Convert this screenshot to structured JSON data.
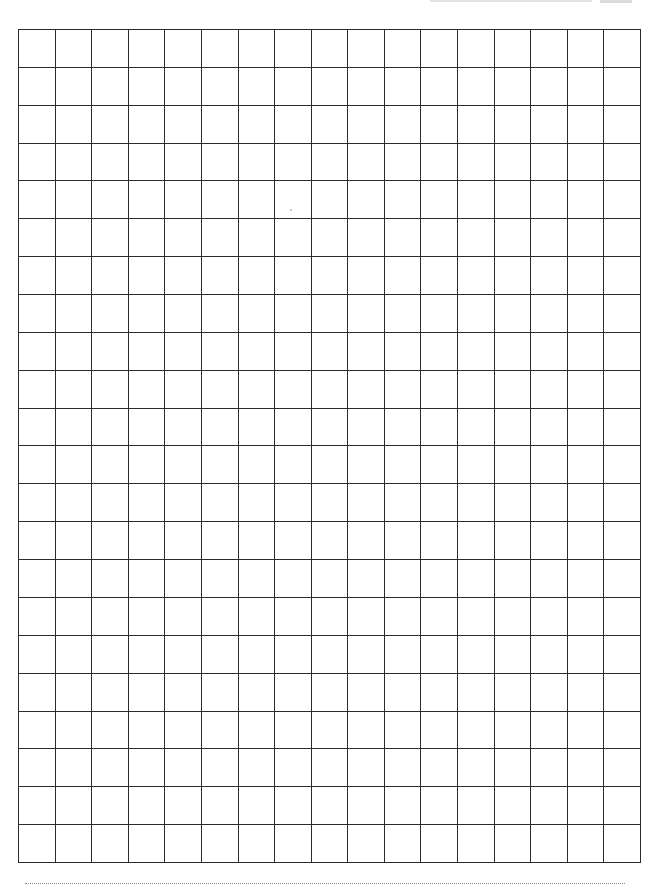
{
  "document": {
    "type": "graph-paper-worksheet",
    "grid": {
      "columns": 17,
      "rows": 22,
      "line_color": "#2b2b2b",
      "cell_fill": "#ffffff",
      "cells_content": []
    },
    "footer_rule": {
      "style": "dotted",
      "color": "#8a8a8a"
    },
    "background_color": "#ffffff"
  }
}
